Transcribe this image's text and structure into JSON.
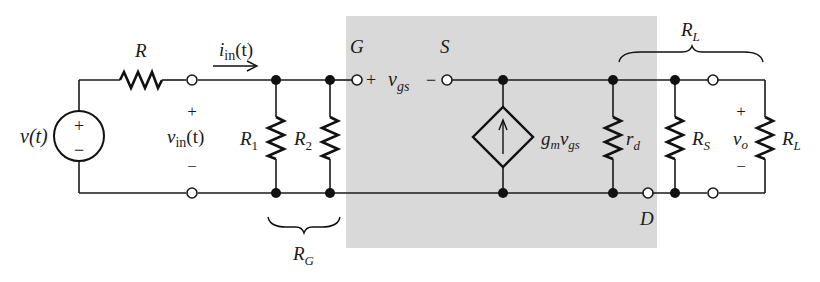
{
  "diagram": {
    "type": "small-signal equivalent circuit (FET common-drain / source follower)",
    "shaded_region": {
      "label": "FET small-signal model",
      "color": "#d9d9d9"
    },
    "source": {
      "label": "v(t)",
      "plus": "+",
      "minus": "−"
    },
    "resistors": {
      "R": {
        "name": "R"
      },
      "R1": {
        "name": "R",
        "sub": "1"
      },
      "R2": {
        "name": "R",
        "sub": "2"
      },
      "rd": {
        "name": "r",
        "sub": "d"
      },
      "RS": {
        "name": "R",
        "sub": "S"
      },
      "RL": {
        "name": "R",
        "sub": "L"
      }
    },
    "input": {
      "current": {
        "name": "i",
        "sub": "in",
        "arg": "(t)"
      },
      "voltage": {
        "name": "v",
        "sub": "in",
        "arg": "(t)",
        "plus": "+",
        "minus": "−"
      }
    },
    "terminals": {
      "gate": "G",
      "source": "S",
      "drain": "D"
    },
    "vgs": {
      "plus": "+",
      "name": "v",
      "sub": "gs",
      "minus": "−"
    },
    "dependent_source": {
      "gain": "g",
      "gain_sub": "m",
      "ctrl": "v",
      "ctrl_sub": "gs",
      "direction": "up"
    },
    "output": {
      "name": "v",
      "sub": "o",
      "plus": "+",
      "minus": "−"
    },
    "braces": {
      "RG": {
        "name": "R",
        "sub": "G"
      },
      "RLprime": {
        "name": "R",
        "sub": "L",
        "prime": "′"
      }
    }
  }
}
